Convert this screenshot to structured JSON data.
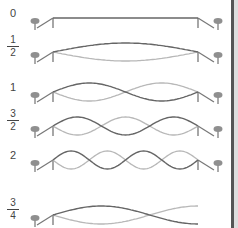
{
  "diagram": {
    "type": "standing-wave modes on a string fixed between two pegs",
    "colors": {
      "wave_primary": "#666666",
      "wave_secondary": "#b8b8b8",
      "string_post": "#777777",
      "peg": "#8f8f8f",
      "label": "#444444",
      "edge": "#555555"
    },
    "rows": [
      {
        "label_whole": "0",
        "label_num": "",
        "label_den": "",
        "half_wavelengths": 0,
        "y": 18
      },
      {
        "label_whole": "",
        "label_num": "1",
        "label_den": "2",
        "half_wavelengths": 1,
        "y": 52
      },
      {
        "label_whole": "1",
        "label_num": "",
        "label_den": "",
        "half_wavelengths": 2,
        "y": 92
      },
      {
        "label_whole": "",
        "label_num": "3",
        "label_den": "2",
        "half_wavelengths": 3,
        "y": 126
      },
      {
        "label_whole": "2",
        "label_num": "",
        "label_den": "",
        "half_wavelengths": 4,
        "y": 160
      },
      {
        "label_whole": "",
        "label_num": "3",
        "label_den": "4",
        "half_wavelengths": 1.5,
        "y": 215
      }
    ]
  }
}
